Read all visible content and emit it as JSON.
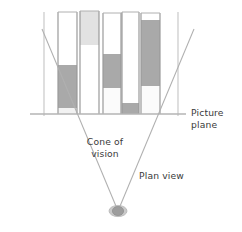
{
  "figure": {
    "type": "technical-illustration",
    "background_color": "#ffffff",
    "width": 242,
    "height": 232
  },
  "labels": {
    "picture_plane": "Picture\nplane",
    "cone_of_vision": "Cone of\nvision",
    "plan_view": "Plan view"
  },
  "colors": {
    "line": "#b0b0b0",
    "line_dark": "#9a9a9a",
    "fill_dark": "#a9a9a9",
    "fill_light": "#e2e2e2",
    "fill_white": "#ffffff",
    "text": "#3a3a3a",
    "viewer": "#9d9d9d"
  },
  "picture_plane": {
    "name": "picture-plane-line",
    "y": 114,
    "x_start": 30,
    "x_end": 186
  },
  "viewer": {
    "name": "viewer-station-point",
    "x": 118,
    "y": 211,
    "rx": 8,
    "ry": 5.5
  },
  "cone_of_vision": {
    "left_ray": {
      "x1": 118,
      "y1": 211,
      "x2": 42,
      "y2": 29
    },
    "right_ray": {
      "x1": 118,
      "y1": 211,
      "x2": 194,
      "y2": 29
    }
  },
  "guide_lines": [
    {
      "name": "guide-line-left",
      "x": 44,
      "y_top": 12,
      "y_bottom": 116
    },
    {
      "name": "guide-line-right",
      "x": 178,
      "y_top": 12,
      "y_bottom": 116
    }
  ],
  "buildings": [
    {
      "name": "building-1",
      "x": 58,
      "width": 19,
      "y_top": 12,
      "y_bottom": 114,
      "bands": [
        {
          "from": 12,
          "to": 65,
          "fill": "#ffffff"
        },
        {
          "from": 65,
          "to": 108,
          "fill": "#a9a9a9"
        },
        {
          "from": 108,
          "to": 114,
          "fill": "#f2f2f2"
        }
      ]
    },
    {
      "name": "building-2",
      "x": 80,
      "width": 19,
      "y_top": 11,
      "y_bottom": 114,
      "bands": [
        {
          "from": 11,
          "to": 45,
          "fill": "#e2e2e2"
        },
        {
          "from": 45,
          "to": 114,
          "fill": "#ffffff"
        }
      ]
    },
    {
      "name": "building-3",
      "x": 103,
      "width": 18,
      "y_top": 13,
      "y_bottom": 114,
      "bands": [
        {
          "from": 13,
          "to": 54,
          "fill": "#ffffff"
        },
        {
          "from": 54,
          "to": 88,
          "fill": "#a9a9a9"
        },
        {
          "from": 88,
          "to": 114,
          "fill": "#fbfbfb"
        }
      ]
    },
    {
      "name": "building-4",
      "x": 122,
      "width": 17,
      "y_top": 12,
      "y_bottom": 114,
      "bands": [
        {
          "from": 12,
          "to": 103,
          "fill": "#ffffff"
        },
        {
          "from": 103,
          "to": 114,
          "fill": "#a9a9a9"
        }
      ]
    },
    {
      "name": "building-5",
      "x": 141,
      "width": 19,
      "y_top": 13,
      "y_bottom": 114,
      "bands": [
        {
          "from": 13,
          "to": 20,
          "fill": "#ffffff"
        },
        {
          "from": 20,
          "to": 86,
          "fill": "#a9a9a9"
        },
        {
          "from": 86,
          "to": 114,
          "fill": "#fbfbfb"
        }
      ]
    }
  ]
}
